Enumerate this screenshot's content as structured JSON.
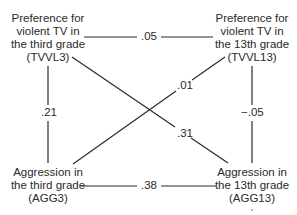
{
  "diagram": {
    "type": "cross-lagged panel correlation",
    "nodes": {
      "tvvl3": {
        "lines": [
          "Preference for",
          "violent TV in",
          "the third grade",
          "(TVVL3)"
        ]
      },
      "tvvl13": {
        "lines": [
          "Preference for",
          "violent TV in",
          "the 13th grade",
          "(TVVL13)"
        ]
      },
      "agg3": {
        "lines": [
          "Aggression in",
          "the third grade",
          "(AGG3)"
        ]
      },
      "agg13": {
        "lines": [
          "Aggression in",
          "the 13th grade",
          "(AGG13)"
        ]
      }
    },
    "edges": [
      {
        "from": "TVVL3",
        "to": "TVVL13",
        "value": ".05"
      },
      {
        "from": "TVVL3",
        "to": "AGG3",
        "value": ".21"
      },
      {
        "from": "TVVL13",
        "to": "AGG13",
        "value": "−.05"
      },
      {
        "from": "AGG3",
        "to": "TVVL13",
        "value": ".01"
      },
      {
        "from": "TVVL3",
        "to": "AGG13",
        "value": ".31"
      },
      {
        "from": "AGG3",
        "to": "AGG13",
        "value": ".38"
      }
    ],
    "colors": {
      "line": "#2a2a2a",
      "text": "#2a2a2a",
      "background": "#ffffff"
    }
  }
}
